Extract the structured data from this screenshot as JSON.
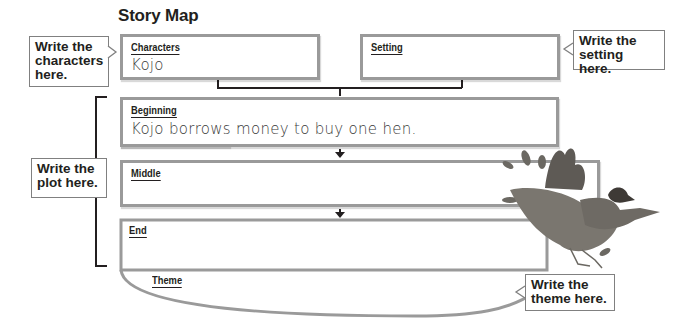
{
  "title": "Story Map",
  "boxes": {
    "characters": {
      "label": "Characters",
      "value": "Kojo"
    },
    "setting": {
      "label": "Setting",
      "value": ""
    },
    "beginning": {
      "label": "Beginning",
      "value": "Kojo borrows money to buy one hen."
    },
    "middle": {
      "label": "Middle",
      "value": ""
    },
    "end": {
      "label": "End",
      "value": ""
    },
    "theme": {
      "label": "Theme",
      "value": ""
    }
  },
  "callouts": {
    "characters": "Write the characters here.",
    "setting": "Write the setting here.",
    "plot": "Write the plot here.",
    "theme": "Write the theme here."
  },
  "colors": {
    "box_border": "#9a9a9a",
    "text": "#231f20",
    "callout_border": "#808080"
  },
  "illustration": "hen-illustration"
}
